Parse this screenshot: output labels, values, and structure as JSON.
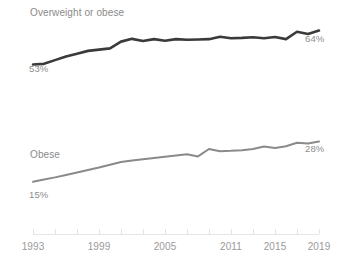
{
  "chart_data": {
    "type": "line",
    "title": "",
    "subtitle": "",
    "xlabel": "",
    "ylabel": "",
    "grid": false,
    "legend_position": "inline-labels",
    "xlim": [
      1993,
      2019
    ],
    "ylim": [
      0,
      70
    ],
    "x_ticks": [
      "1993",
      "1999",
      "2005",
      "2011",
      "2015",
      "2019"
    ],
    "x_tick_values": [
      1993,
      1999,
      2005,
      2011,
      2015,
      2019
    ],
    "x": [
      1993,
      1994,
      1995,
      1996,
      1997,
      1998,
      1999,
      2000,
      2001,
      2002,
      2003,
      2004,
      2005,
      2006,
      2007,
      2008,
      2009,
      2010,
      2011,
      2012,
      2013,
      2014,
      2015,
      2016,
      2017,
      2018,
      2019
    ],
    "series": [
      {
        "name": "Overweight or obese",
        "color": "#3a3a3a",
        "start_label": "53%",
        "end_label": "64%",
        "start_value": 53,
        "end_value": 64,
        "values": [
          53,
          53.2,
          54.4,
          55.6,
          56.5,
          57.4,
          57.8,
          58.2,
          60.4,
          61.3,
          60.6,
          61.2,
          60.7,
          61.2,
          61.0,
          61.1,
          61.2,
          62.0,
          61.5,
          61.6,
          61.8,
          61.5,
          61.9,
          61.2,
          63.6,
          62.9,
          64
        ]
      },
      {
        "name": "Obese",
        "color": "#8a8a8a",
        "start_label": "15%",
        "end_label": "28%",
        "start_value": 15,
        "end_value": 28,
        "values": [
          15,
          15.7,
          16.4,
          17.2,
          18.0,
          18.8,
          19.6,
          20.5,
          21.4,
          21.9,
          22.3,
          22.7,
          23.1,
          23.5,
          23.9,
          23.2,
          25.6,
          24.9,
          25.0,
          25.2,
          25.6,
          26.4,
          25.9,
          26.5,
          27.6,
          27.4,
          28
        ]
      }
    ],
    "annotations": [
      {
        "id": "series-label-top",
        "text": "Overweight or obese",
        "kind": "series-name"
      },
      {
        "id": "start-label-top",
        "text": "53%",
        "kind": "value"
      },
      {
        "id": "end-label-top",
        "text": "64%",
        "kind": "value"
      },
      {
        "id": "series-label-bot",
        "text": "Obese",
        "kind": "series-name"
      },
      {
        "id": "start-label-bot",
        "text": "15%",
        "kind": "value"
      },
      {
        "id": "end-label-bot",
        "text": "28%",
        "kind": "value"
      }
    ],
    "colors": {
      "background": "#ffffff",
      "axis": "#e6e6e6",
      "text": "#8d8d8d",
      "series_top": "#3a3a3a",
      "series_bottom": "#8a8a8a"
    }
  }
}
